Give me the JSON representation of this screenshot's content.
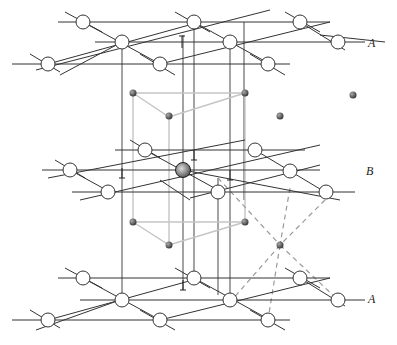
{
  "diagram": {
    "type": "hcp-stacking-interstitial",
    "layers": [
      {
        "label": "A",
        "position": "top"
      },
      {
        "label": "B",
        "position": "middle"
      },
      {
        "label": "A",
        "position": "bottom"
      }
    ],
    "colors": {
      "lattice_line": "#333333",
      "atom_fill": "#ffffff",
      "unit_cell_line": "#c4c4c4",
      "tetrahedral_dash": "#999999",
      "interstitial": "#555555"
    }
  }
}
